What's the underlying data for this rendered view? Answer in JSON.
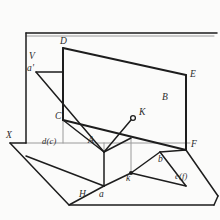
{
  "figure": {
    "kind": "descriptive-geometry-projection-diagram",
    "background_color": "#fbfbfa",
    "stroke_color": "#1d1d1d",
    "axis_color": "#8e8e8e",
    "width": 220,
    "height": 220
  },
  "labels": {
    "plane_v": "V",
    "a_prime": "a'",
    "point_d": "D",
    "point_e": "E",
    "point_b": "B",
    "point_c": "C",
    "point_k_upper": "K",
    "point_a_upper": "A",
    "point_f": "F",
    "point_x": "X",
    "point_h": "H",
    "trace_dc": "d(c)",
    "trace_ef": "e(f)",
    "point_b_lower": "b",
    "point_k_lower": "k",
    "point_a_lower": "a"
  },
  "label_positions": {
    "plane_v": [
      29,
      58
    ],
    "a_prime": [
      28,
      70
    ],
    "point_d": [
      61,
      43
    ],
    "point_e": [
      189,
      76
    ],
    "point_b": [
      163,
      99
    ],
    "point_c": [
      57,
      118
    ],
    "point_k_upper": [
      139,
      113
    ],
    "point_a_upper": [
      89,
      142
    ],
    "point_f": [
      191,
      146
    ],
    "point_x": [
      7,
      137
    ],
    "point_h": [
      79,
      196
    ],
    "trace_dc": [
      43,
      143
    ],
    "trace_ef": [
      175,
      177
    ],
    "point_b_lower": [
      159,
      160
    ],
    "point_k_lower": [
      127,
      177
    ],
    "point_a_lower": [
      99,
      196
    ]
  },
  "geometry": {
    "outer_frame": "M 26,33 L 217,33",
    "v_plane_left_edge": "M 26,33 L 26,143",
    "ground_plane_outline": "M 26,143 L 10,143 L 69,205 L 214,205 L 218,156",
    "x_axis_horizontal": "M 26,143 L 190,143",
    "quad_top": "M 63,48 L 63,120",
    "quad_top_slope": "M 63,48 L 186,75",
    "quad_right_vert": "M 186,75 L 186,150",
    "quad_lower_slope": "M 63,120 L 186,150",
    "a_prime_to_plane": "M 36,72 L 63,72",
    "a_prime_to_a": "M 36,72 L 104,152",
    "c_to_a": "M 63,120 L 104,152",
    "a_to_k_upper": "M 104,152 L 133,118",
    "k_marker_center": [
      133,
      118
    ],
    "k_marker_radius": 2.4,
    "a_box_vert": "M 104,152 L 104,186",
    "a_box_vert2": "M 131,138 L 131,173",
    "a_box_top": "M 104,152 L 131,138",
    "a_box_bottom": "M 104,186 L 131,173",
    "lower_left_slope": "M 26,156 L 104,186",
    "k_to_b": "M 131,173 L 160,152",
    "b_to_f": "M 160,152 L 186,150",
    "b_down_f": "M 160,152 L 186,186",
    "k_to_ef": "M 131,173 L 186,186",
    "ef_tail": "M 186,150 L 218,196",
    "a_lower_to_k": "M 104,186 L 131,173",
    "h_slope": "M 69,205 L 104,186",
    "left_diag_from_x": "M 10,143 L 69,205",
    "c_marker": "M 63,120 L 104,152",
    "small_vert_a": "M 104,152 L 104,186"
  }
}
